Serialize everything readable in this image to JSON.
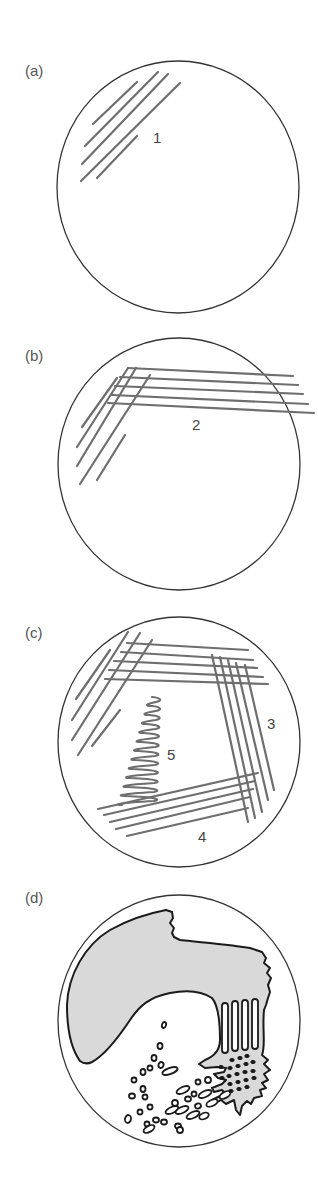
{
  "figure": {
    "panels": [
      {
        "id": "a",
        "label": "(a)",
        "streak_labels": [
          "1"
        ]
      },
      {
        "id": "b",
        "label": "(b)",
        "streak_labels": [
          "2"
        ]
      },
      {
        "id": "c",
        "label": "(c)",
        "streak_labels": [
          "3",
          "4",
          "5"
        ]
      },
      {
        "id": "d",
        "label": "(d)",
        "streak_labels": []
      }
    ]
  },
  "colors": {
    "plate_outline": "#333333",
    "streak": "#6e6e6e",
    "confluent_growth": "#d9d9d9",
    "outline": "#1a1a1a"
  }
}
